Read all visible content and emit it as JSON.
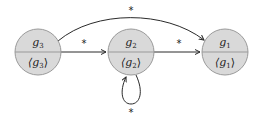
{
  "diagram": {
    "type": "state-graph",
    "node_fill": "#d9d9d9",
    "node_stroke": "#9a9a9a",
    "edge_color": "#2a2a2a",
    "nodes": [
      {
        "id": "g3",
        "top": "g",
        "top_sub": "3",
        "bottom": "⟨g",
        "bottom_sub": "3",
        "bottom_close": "⟩"
      },
      {
        "id": "g2",
        "top": "g",
        "top_sub": "2",
        "bottom": "⟨g",
        "bottom_sub": "2",
        "bottom_close": "⟩"
      },
      {
        "id": "g1",
        "top": "g",
        "top_sub": "1",
        "bottom": "⟨g",
        "bottom_sub": "1",
        "bottom_close": "⟩"
      }
    ],
    "edges": [
      {
        "from": "g3",
        "to": "g2",
        "label": "*"
      },
      {
        "from": "g2",
        "to": "g1",
        "label": "*"
      },
      {
        "from": "g3",
        "to": "g1",
        "label": "*"
      },
      {
        "from": "g2",
        "to": "g2",
        "label": "*"
      }
    ]
  }
}
